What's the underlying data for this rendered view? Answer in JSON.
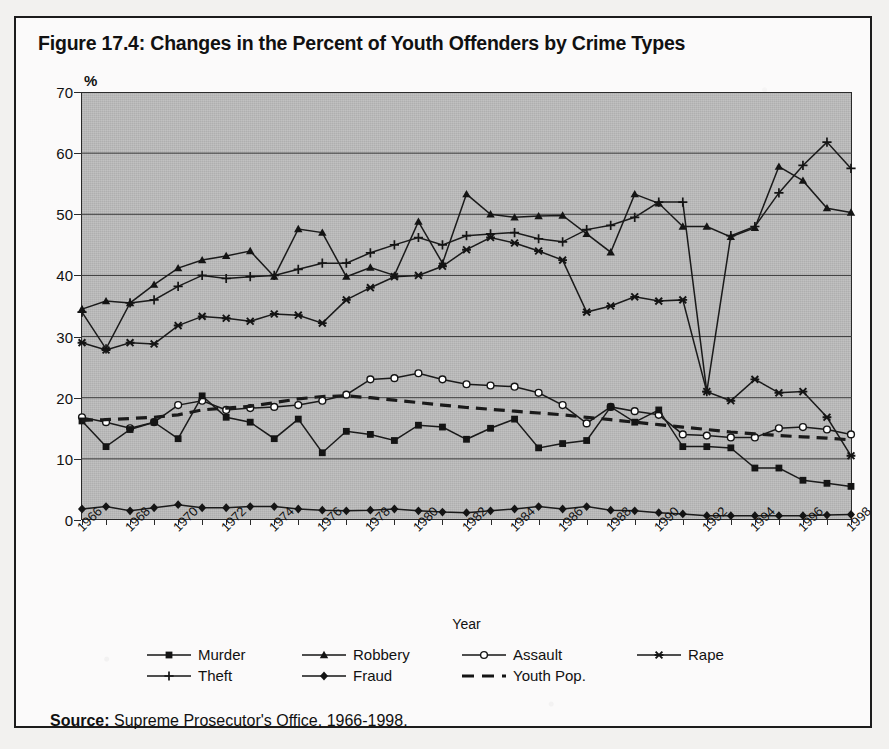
{
  "figure": {
    "title": "Figure 17.4: Changes in the Percent of Youth Offenders by Crime Types",
    "source_label": "Source:",
    "source_text": " Supreme Prosecutor's Office, 1966-1998."
  },
  "axes": {
    "y_unit": "%",
    "x_title": "Year",
    "y_ticks": [
      "0",
      "10",
      "20",
      "30",
      "40",
      "50",
      "60",
      "70"
    ],
    "x_ticks": [
      "1966",
      "1968",
      "1970",
      "1972",
      "1974",
      "1976",
      "1978",
      "1980",
      "1982",
      "1984",
      "1986",
      "1988",
      "1990",
      "1992",
      "1994",
      "1996",
      "1998"
    ]
  },
  "legend": {
    "items": [
      {
        "label": "Murder",
        "marker": "square-icon",
        "style": "solid"
      },
      {
        "label": "Robbery",
        "marker": "triangle-icon",
        "style": "solid"
      },
      {
        "label": "Assault",
        "marker": "open-circle-icon",
        "style": "solid"
      },
      {
        "label": "Rape",
        "marker": "star-icon",
        "style": "solid"
      },
      {
        "label": "Theft",
        "marker": "plus-icon",
        "style": "solid"
      },
      {
        "label": "Fraud",
        "marker": "diamond-icon",
        "style": "solid"
      },
      {
        "label": "Youth Pop.",
        "marker": "none",
        "style": "dashed"
      }
    ]
  },
  "chart_data": {
    "type": "line",
    "title": "Figure 17.4: Changes in the Percent of Youth Offenders by Crime Types",
    "xlabel": "Year",
    "ylabel": "%",
    "ylim": [
      0,
      70
    ],
    "ytick_step": 10,
    "grid": "horizontal",
    "legend_position": "bottom",
    "plot_background": "#b8b8b8",
    "line_color": "#1a1a1a",
    "x": [
      1966,
      1967,
      1968,
      1969,
      1970,
      1971,
      1972,
      1973,
      1974,
      1975,
      1976,
      1977,
      1978,
      1979,
      1980,
      1981,
      1982,
      1983,
      1984,
      1985,
      1986,
      1987,
      1988,
      1989,
      1990,
      1991,
      1992,
      1993,
      1994,
      1995,
      1996,
      1997,
      1998
    ],
    "series": [
      {
        "name": "Robbery",
        "marker": "triangle",
        "values": [
          34.5,
          35.8,
          35.5,
          38.5,
          41.2,
          42.5,
          43.2,
          44.0,
          39.8,
          47.6,
          47.0,
          39.8,
          41.3,
          40.0,
          48.8,
          42.0,
          53.3,
          50.0,
          49.5,
          49.7,
          49.8,
          46.8,
          43.8,
          53.3,
          51.8,
          48.0,
          48.0,
          46.3,
          47.8,
          57.8,
          55.5,
          51.0,
          50.3
        ]
      },
      {
        "name": "Theft",
        "marker": "plus",
        "values": [
          34.0,
          28.0,
          35.5,
          36.0,
          38.2,
          40.0,
          39.5,
          39.8,
          40.0,
          41.0,
          42.0,
          42.0,
          43.7,
          45.0,
          46.2,
          45.0,
          46.5,
          46.8,
          47.0,
          46.0,
          45.5,
          47.5,
          48.2,
          49.5,
          52.0,
          52.0,
          21.0,
          46.5,
          48.0,
          53.5,
          58.0,
          61.8,
          57.5
        ]
      },
      {
        "name": "Rape",
        "marker": "star",
        "values": [
          29.0,
          27.8,
          29.0,
          28.8,
          31.8,
          33.3,
          33.0,
          32.5,
          33.7,
          33.5,
          32.2,
          36.0,
          38.0,
          39.8,
          40.0,
          41.5,
          44.2,
          46.2,
          45.3,
          44.0,
          42.5,
          34.0,
          35.0,
          36.5,
          35.8,
          36.0,
          21.0,
          19.5,
          23.0,
          20.8,
          21.0,
          16.8,
          10.5
        ]
      },
      {
        "name": "Assault",
        "marker": "open-circle",
        "values": [
          16.8,
          16.0,
          15.0,
          16.0,
          18.8,
          19.5,
          18.0,
          18.3,
          18.5,
          18.8,
          19.5,
          20.5,
          23.0,
          23.2,
          24.0,
          23.0,
          22.2,
          22.0,
          21.8,
          20.8,
          18.8,
          15.8,
          18.5,
          17.8,
          17.2,
          14.0,
          13.8,
          13.5,
          13.5,
          15.0,
          15.2,
          14.8,
          14.0
        ]
      },
      {
        "name": "Murder",
        "marker": "square",
        "values": [
          16.2,
          12.0,
          14.8,
          16.0,
          13.3,
          20.3,
          16.8,
          16.0,
          13.3,
          16.5,
          11.0,
          14.5,
          14.0,
          13.0,
          15.5,
          15.2,
          13.2,
          15.0,
          16.5,
          11.8,
          12.5,
          13.0,
          18.5,
          16.0,
          18.0,
          12.0,
          12.0,
          11.8,
          8.5,
          8.5,
          6.5,
          6.0,
          5.5
        ]
      },
      {
        "name": "Fraud",
        "marker": "diamond",
        "values": [
          1.8,
          2.2,
          1.5,
          2.0,
          2.5,
          2.0,
          2.0,
          2.2,
          2.2,
          1.8,
          1.6,
          1.5,
          1.6,
          1.8,
          1.5,
          1.3,
          1.2,
          1.5,
          1.8,
          2.2,
          1.8,
          2.2,
          1.6,
          1.5,
          1.2,
          1.0,
          0.7,
          0.7,
          0.7,
          0.7,
          0.7,
          0.8,
          0.9
        ]
      },
      {
        "name": "Youth Pop.",
        "marker": "none",
        "dashed": true,
        "values": [
          16.3,
          16.4,
          16.6,
          16.8,
          17.2,
          18.0,
          18.3,
          18.6,
          19.2,
          19.8,
          20.2,
          20.3,
          20.0,
          19.6,
          19.2,
          18.8,
          18.4,
          18.1,
          17.8,
          17.5,
          17.2,
          16.8,
          16.4,
          16.0,
          15.6,
          15.2,
          14.8,
          14.4,
          14.1,
          13.8,
          13.6,
          13.4,
          13.1
        ]
      }
    ]
  }
}
